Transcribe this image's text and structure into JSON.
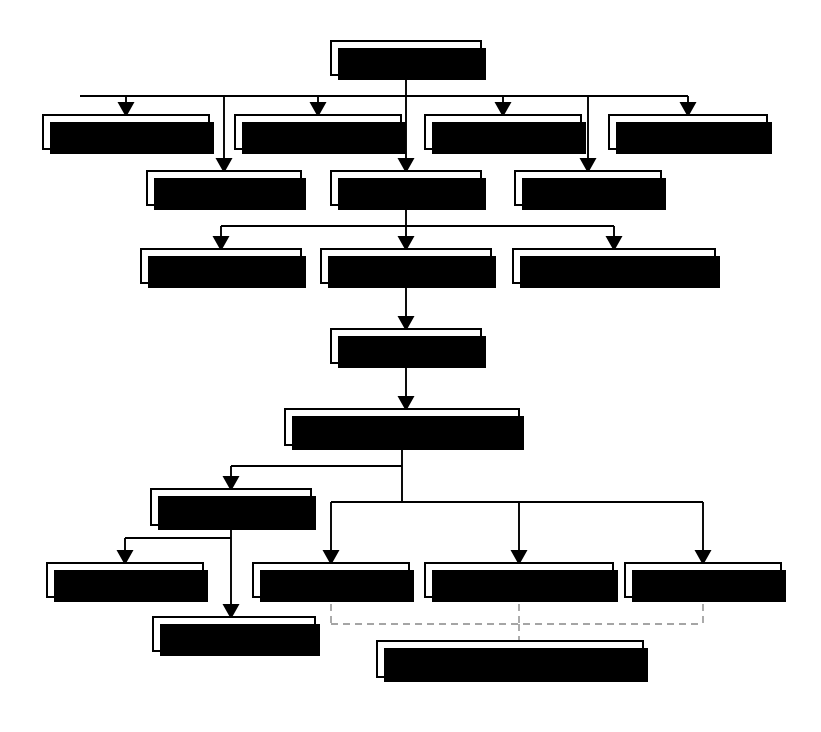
{
  "diagram": {
    "colors": {
      "box_fill": "#ffffff",
      "box_border": "#000000",
      "shadow": "#000000",
      "connector": "#000000",
      "dashed_connector": "#888888"
    },
    "nodes": [
      {
        "id": "the-firm",
        "label": "The Firm",
        "x": 330,
        "y": 40,
        "w": 152,
        "h": 36
      },
      {
        "id": "hive-off-units",
        "label": "Hive off units",
        "x": 42,
        "y": 114,
        "w": 168,
        "h": 36
      },
      {
        "id": "contract-labour",
        "label": "Contract labour",
        "x": 234,
        "y": 114,
        "w": 168,
        "h": 36
      },
      {
        "id": "agency-labour",
        "label": "Agency labour",
        "x": 424,
        "y": 114,
        "w": 158,
        "h": 36
      },
      {
        "id": "homeworkers",
        "label": "Homeworkers",
        "x": 608,
        "y": 114,
        "w": 160,
        "h": 36
      },
      {
        "id": "subcontract",
        "label": "Subcontract",
        "x": 146,
        "y": 170,
        "w": 156,
        "h": 36
      },
      {
        "id": "direct-labour",
        "label": "Direct labour",
        "x": 330,
        "y": 170,
        "w": 152,
        "h": 36
      },
      {
        "id": "teleworkers",
        "label": "Teleworkers",
        "x": 514,
        "y": 170,
        "w": 148,
        "h": 36
      },
      {
        "id": "casual-labour",
        "label": "Casual labour",
        "x": 140,
        "y": 248,
        "w": 162,
        "h": 36
      },
      {
        "id": "regular-workers",
        "label": "Regular workers",
        "x": 320,
        "y": 248,
        "w": 172,
        "h": 36
      },
      {
        "id": "family-unpaid",
        "label": "Family/unpaid labour",
        "x": 512,
        "y": 248,
        "w": 204,
        "h": 36
      },
      {
        "id": "core-non-core",
        "label": "Core/Non-core",
        "x": 330,
        "y": 328,
        "w": 152,
        "h": 36
      },
      {
        "id": "employment-contract",
        "label": "Employment contract",
        "x": 284,
        "y": 408,
        "w": 236,
        "h": 38
      },
      {
        "id": "trainee",
        "label": "Trainee",
        "x": 150,
        "y": 488,
        "w": 162,
        "h": 38
      },
      {
        "id": "informal",
        "label": "Informal",
        "x": 46,
        "y": 562,
        "w": 158,
        "h": 36
      },
      {
        "id": "probation",
        "label": "Probation",
        "x": 252,
        "y": 562,
        "w": 158,
        "h": 36
      },
      {
        "id": "individual-contract",
        "label": "Individual contract",
        "x": 424,
        "y": 562,
        "w": 190,
        "h": 36
      },
      {
        "id": "group-contract",
        "label": "Group contract",
        "x": 624,
        "y": 562,
        "w": 158,
        "h": 36
      },
      {
        "id": "apprentice",
        "label": "Apprentice",
        "x": 152,
        "y": 616,
        "w": 164,
        "h": 36
      },
      {
        "id": "duration-terms",
        "label": "Duration, Terms, Coverage",
        "x": 376,
        "y": 640,
        "w": 268,
        "h": 38
      }
    ],
    "edges": [
      {
        "from": "the-firm",
        "to": "hive-off-units",
        "style": "solid"
      },
      {
        "from": "the-firm",
        "to": "contract-labour",
        "style": "solid"
      },
      {
        "from": "the-firm",
        "to": "agency-labour",
        "style": "solid"
      },
      {
        "from": "the-firm",
        "to": "homeworkers",
        "style": "solid"
      },
      {
        "from": "the-firm",
        "to": "subcontract",
        "style": "solid"
      },
      {
        "from": "the-firm",
        "to": "direct-labour",
        "style": "solid"
      },
      {
        "from": "the-firm",
        "to": "teleworkers",
        "style": "solid"
      },
      {
        "from": "direct-labour",
        "to": "casual-labour",
        "style": "solid"
      },
      {
        "from": "direct-labour",
        "to": "regular-workers",
        "style": "solid"
      },
      {
        "from": "direct-labour",
        "to": "family-unpaid",
        "style": "solid"
      },
      {
        "from": "regular-workers",
        "to": "core-non-core",
        "style": "solid"
      },
      {
        "from": "core-non-core",
        "to": "employment-contract",
        "style": "solid"
      },
      {
        "from": "employment-contract",
        "to": "trainee",
        "style": "solid"
      },
      {
        "from": "employment-contract",
        "to": "probation",
        "style": "solid"
      },
      {
        "from": "employment-contract",
        "to": "individual-contract",
        "style": "solid"
      },
      {
        "from": "employment-contract",
        "to": "group-contract",
        "style": "solid"
      },
      {
        "from": "trainee",
        "to": "informal",
        "style": "solid"
      },
      {
        "from": "trainee",
        "to": "apprentice",
        "style": "solid"
      },
      {
        "from": "probation",
        "to": "duration-terms",
        "style": "dashed"
      },
      {
        "from": "individual-contract",
        "to": "duration-terms",
        "style": "dashed"
      },
      {
        "from": "group-contract",
        "to": "duration-terms",
        "style": "dashed"
      }
    ]
  }
}
